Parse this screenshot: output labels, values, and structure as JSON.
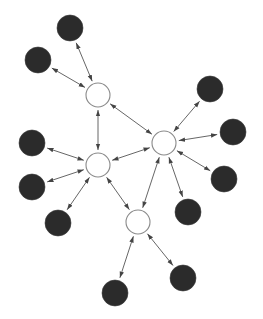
{
  "diagram": {
    "type": "network",
    "width": 263,
    "height": 319,
    "colors": {
      "background": "#ffffff",
      "hollow_fill": "#ffffff",
      "hollow_stroke": "#8a8a8a",
      "dark_fill": "#2b2b2b",
      "edge": "#555555"
    },
    "node_radius": {
      "hollow": 12,
      "dark": 13
    },
    "nodes": [
      {
        "id": "h1",
        "kind": "hollow",
        "x": 98,
        "y": 95
      },
      {
        "id": "h2",
        "kind": "hollow",
        "x": 164,
        "y": 143
      },
      {
        "id": "h3",
        "kind": "hollow",
        "x": 98,
        "y": 165
      },
      {
        "id": "h4",
        "kind": "hollow",
        "x": 138,
        "y": 222
      },
      {
        "id": "d1",
        "kind": "dark",
        "x": 70,
        "y": 28
      },
      {
        "id": "d2",
        "kind": "dark",
        "x": 38,
        "y": 60
      },
      {
        "id": "d3",
        "kind": "dark",
        "x": 210,
        "y": 89
      },
      {
        "id": "d4",
        "kind": "dark",
        "x": 233,
        "y": 132
      },
      {
        "id": "d5",
        "kind": "dark",
        "x": 224,
        "y": 179
      },
      {
        "id": "d6",
        "kind": "dark",
        "x": 188,
        "y": 212
      },
      {
        "id": "d7",
        "kind": "dark",
        "x": 32,
        "y": 143
      },
      {
        "id": "d8",
        "kind": "dark",
        "x": 32,
        "y": 187
      },
      {
        "id": "d9",
        "kind": "dark",
        "x": 58,
        "y": 223
      },
      {
        "id": "d10",
        "kind": "dark",
        "x": 115,
        "y": 293
      },
      {
        "id": "d11",
        "kind": "dark",
        "x": 183,
        "y": 278
      }
    ],
    "edges": [
      {
        "from": "d1",
        "to": "h1",
        "bidirectional": true
      },
      {
        "from": "d2",
        "to": "h1",
        "bidirectional": true
      },
      {
        "from": "h1",
        "to": "h3",
        "bidirectional": true
      },
      {
        "from": "h1",
        "to": "h2",
        "bidirectional": true
      },
      {
        "from": "d3",
        "to": "h2",
        "bidirectional": true
      },
      {
        "from": "d4",
        "to": "h2",
        "bidirectional": true
      },
      {
        "from": "d5",
        "to": "h2",
        "bidirectional": true
      },
      {
        "from": "d6",
        "to": "h2",
        "bidirectional": true
      },
      {
        "from": "h2",
        "to": "h4",
        "bidirectional": true
      },
      {
        "from": "h2",
        "to": "h3",
        "bidirectional": true
      },
      {
        "from": "d7",
        "to": "h3",
        "bidirectional": true
      },
      {
        "from": "d8",
        "to": "h3",
        "bidirectional": true
      },
      {
        "from": "d9",
        "to": "h3",
        "bidirectional": true
      },
      {
        "from": "h3",
        "to": "h4",
        "bidirectional": true
      },
      {
        "from": "d10",
        "to": "h4",
        "bidirectional": true
      },
      {
        "from": "d11",
        "to": "h4",
        "bidirectional": true
      }
    ]
  }
}
